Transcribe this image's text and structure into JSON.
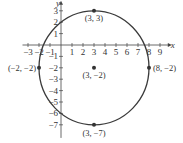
{
  "chart_data": {
    "type": "scatter",
    "title": "",
    "xlabel": "x",
    "ylabel": "y",
    "xlim": [
      -3.5,
      9.8
    ],
    "ylim": [
      -7.8,
      3.7
    ],
    "grid": false,
    "x_ticks": [
      -3,
      -2,
      -1,
      1,
      2,
      3,
      4,
      5,
      6,
      7,
      8,
      9
    ],
    "y_ticks": [
      3,
      2,
      1,
      -1,
      -2,
      -3,
      -4,
      -5,
      -6,
      -7
    ],
    "circle": {
      "center": [
        3,
        -2
      ],
      "radius": 5,
      "equation": "(x-3)^2 + (y+2)^2 = 25"
    },
    "points": [
      {
        "x": 3,
        "y": 3,
        "label": "(3, 3)"
      },
      {
        "x": 3,
        "y": -2,
        "label": "(3, −2)"
      },
      {
        "x": -2,
        "y": -2,
        "label": "(−2, −2)"
      },
      {
        "x": 8,
        "y": -2,
        "label": "(8, −2)"
      },
      {
        "x": 3,
        "y": -7,
        "label": "(3, −7)"
      }
    ]
  },
  "colors": {
    "curve": "#3a3a3a",
    "axis": "#444444",
    "point": "#333333"
  }
}
